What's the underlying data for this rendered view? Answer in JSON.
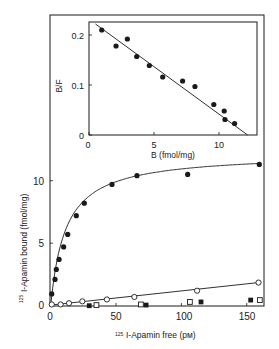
{
  "chart_data": [
    {
      "id": "main",
      "type": "scatter",
      "title": "",
      "xlabel": "125I-Apamin free (pM)",
      "xlabel_sup": "125",
      "xlabel_rest": "I-Apamin free (pм)",
      "ylabel": "125I-Apamin bound (fmol/mg)",
      "ylabel_sup": "125",
      "ylabel_rest": "I-Apamin bound (fmol/mg)",
      "xlim": [
        0,
        160
      ],
      "ylim": [
        0,
        12.5
      ],
      "xticks": [
        0,
        50,
        100,
        150
      ],
      "yticks": [
        0,
        5,
        10
      ],
      "grid": false,
      "legend": null,
      "series": [
        {
          "name": "total/specific (filled circles)",
          "marker": "filled-circle",
          "line": "hyperbolic fit",
          "x": [
            0.8,
            3.3,
            4.3,
            6.4,
            9.9,
            13.0,
            19.6,
            25.7,
            46.9,
            66.0,
            104.8,
            159.6
          ],
          "y": [
            0.94,
            2.1,
            2.9,
            3.7,
            4.7,
            5.7,
            7.2,
            8.2,
            9.7,
            10.4,
            10.5,
            11.3
          ],
          "fit": {
            "Bmax": 12.2,
            "Kd": 11.5
          }
        },
        {
          "name": "nonspecific (open circles)",
          "marker": "open-circle",
          "line": "linear",
          "x": [
            0.8,
            7.6,
            14.0,
            24.2,
            43.0,
            64.0,
            112.0,
            159.0
          ],
          "y": [
            0.1,
            0.1,
            0.2,
            0.35,
            0.5,
            0.7,
            1.2,
            1.85
          ]
        },
        {
          "name": "filled squares",
          "marker": "filled-square",
          "line": "none",
          "x": [
            29.5,
            73.0,
            115.0,
            153.0
          ],
          "y": [
            0.0,
            0.05,
            0.3,
            0.45
          ]
        },
        {
          "name": "open squares",
          "marker": "open-square",
          "line": "none",
          "x": [
            35.0,
            69.0,
            106.5,
            160.0
          ],
          "y": [
            0.05,
            0.1,
            0.3,
            0.45
          ]
        }
      ]
    },
    {
      "id": "inset",
      "type": "scatter",
      "title": "Scatchard plot (inset)",
      "xlabel": "B (fmol/mg)",
      "ylabel": "B/F",
      "xlim": [
        0,
        13
      ],
      "ylim": [
        0,
        0.23
      ],
      "xticks": [
        0,
        5,
        10
      ],
      "yticks": [
        0,
        0.1,
        0.2
      ],
      "grid": false,
      "series": [
        {
          "name": "B/F vs B",
          "marker": "filled-circle",
          "line": "linear regression",
          "x": [
            0.98,
            2.08,
            2.95,
            3.67,
            4.64,
            5.67,
            7.2,
            8.15,
            9.6,
            10.4,
            10.46,
            11.2
          ],
          "y": [
            0.21,
            0.178,
            0.192,
            0.157,
            0.139,
            0.116,
            0.108,
            0.097,
            0.061,
            0.048,
            0.031,
            0.023
          ],
          "fit_line": {
            "x": [
              0.5,
              12.2
            ],
            "y": [
              0.222,
              0.0
            ]
          }
        }
      ]
    }
  ],
  "labels": {
    "main_x_ticks": [
      "0",
      "50",
      "100",
      "150"
    ],
    "main_y_ticks": [
      "0",
      "5",
      "10"
    ],
    "inset_x_ticks": [
      "0",
      "5",
      "10"
    ],
    "inset_y_ticks": [
      "0",
      "0.1",
      "0.2"
    ],
    "inset_xlabel": "B (fmol/mg)",
    "inset_ylabel": "B/F",
    "main_xlabel_sup": "125",
    "main_xlabel_rest": "I-Apamin free (pм)",
    "main_ylabel_sup": "125",
    "main_ylabel_rest": "I-Apamin bound (fmol/mg)"
  },
  "colors": {
    "ink": "#1a1a1a",
    "background": "#ffffff"
  }
}
